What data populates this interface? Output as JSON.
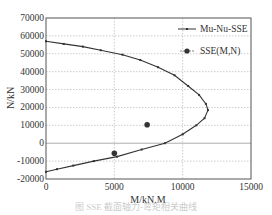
{
  "chart_data": {
    "type": "line",
    "title": "",
    "xlabel": "M/kN.M",
    "ylabel": "N/kN",
    "xlim": [
      0,
      15000
    ],
    "ylim": [
      -20000,
      70000
    ],
    "x_ticks": [
      0,
      5000,
      10000,
      15000
    ],
    "y_ticks": [
      -20000,
      -10000,
      0,
      10000,
      20000,
      30000,
      40000,
      50000,
      60000,
      70000
    ],
    "grid": true,
    "legend_position": "upper right",
    "series": [
      {
        "name": "Mu-Nu-SSE",
        "style": "line-with-small-markers",
        "color": "#333333",
        "points": [
          [
            0,
            57000
          ],
          [
            1300,
            55500
          ],
          [
            2700,
            54000
          ],
          [
            4000,
            52000
          ],
          [
            5600,
            49500
          ],
          [
            6900,
            46500
          ],
          [
            8200,
            42500
          ],
          [
            9400,
            38000
          ],
          [
            10400,
            32000
          ],
          [
            11200,
            27000
          ],
          [
            11700,
            22000
          ],
          [
            11850,
            18500
          ],
          [
            11600,
            14000
          ],
          [
            11000,
            10000
          ],
          [
            10000,
            5000
          ],
          [
            8700,
            0
          ],
          [
            7000,
            -3500
          ],
          [
            5200,
            -7500
          ],
          [
            3500,
            -10000
          ],
          [
            2000,
            -12500
          ],
          [
            800,
            -14500
          ],
          [
            0,
            -16000
          ]
        ]
      },
      {
        "name": "SSE(M,N)",
        "style": "markers",
        "color": "#333333",
        "points": [
          [
            7400,
            10300
          ],
          [
            5000,
            -5600
          ]
        ]
      }
    ]
  },
  "caption": "图    SSE 截面轴力-弯矩相关曲线"
}
